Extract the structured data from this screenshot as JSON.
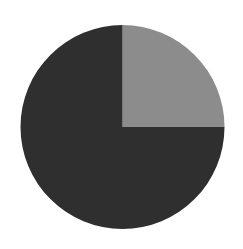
{
  "chart_data": {
    "type": "pie",
    "title": "",
    "categories": [
      "Slice A",
      "Slice B"
    ],
    "values": [
      25,
      75
    ],
    "colors": [
      "#8c8c8c",
      "#2f2f2f"
    ],
    "start_angle_deg": 90,
    "direction": "clockwise",
    "legend": "none",
    "data_labels": "none",
    "center": [
      122.5,
      127
    ],
    "radius": 102
  }
}
